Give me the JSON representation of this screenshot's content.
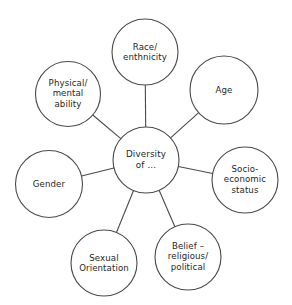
{
  "diagram": {
    "type": "hub-and-spoke",
    "title": "Diversity of ...",
    "stroke_color": "#4a4a4a",
    "text_color": "#262626",
    "background_color": "#ffffff",
    "center": {
      "id": "diversity-of",
      "label": "Diversity\nof ...",
      "cx": 146,
      "cy": 160,
      "r": 33
    },
    "nodes": [
      {
        "id": "race-enthnicity",
        "label": "Race/\nenthnicity",
        "cx": 145,
        "cy": 52,
        "r": 33
      },
      {
        "id": "age",
        "label": "Age",
        "cx": 224,
        "cy": 90,
        "r": 34
      },
      {
        "id": "socio-economic-status",
        "label": "Socio-\neconomic\nstatus",
        "cx": 245,
        "cy": 180,
        "r": 33
      },
      {
        "id": "belief-religious-political",
        "label": "Belief –\nreligious/\npolitical",
        "cx": 188,
        "cy": 257,
        "r": 33
      },
      {
        "id": "sexual-orientation",
        "label": "Sexual\nOrientation",
        "cx": 104,
        "cy": 263,
        "r": 33
      },
      {
        "id": "gender",
        "label": "Gender",
        "cx": 49,
        "cy": 184,
        "r": 33.5
      },
      {
        "id": "physical-mental-ability",
        "label": "Physical/\nmental\nability",
        "cx": 68,
        "cy": 94,
        "r": 32.5
      }
    ],
    "connectors": [
      {
        "id": "connector-race",
        "from": "diversity-of",
        "to": "race-enthnicity"
      },
      {
        "id": "connector-age",
        "from": "diversity-of",
        "to": "age"
      },
      {
        "id": "connector-socio",
        "from": "diversity-of",
        "to": "socio-economic-status"
      },
      {
        "id": "connector-belief",
        "from": "diversity-of",
        "to": "belief-religious-political"
      },
      {
        "id": "connector-sexual-orientation",
        "from": "diversity-of",
        "to": "sexual-orientation"
      },
      {
        "id": "connector-gender",
        "from": "diversity-of",
        "to": "gender"
      },
      {
        "id": "connector-physical",
        "from": "diversity-of",
        "to": "physical-mental-ability"
      }
    ]
  }
}
